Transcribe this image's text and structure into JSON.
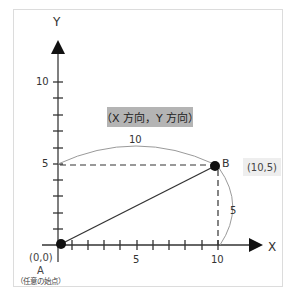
{
  "diagram": {
    "axes": {
      "x_label": "X",
      "y_label": "Y",
      "x_ticks": [
        "5",
        "10"
      ],
      "y_ticks": [
        "10",
        "5"
      ]
    },
    "direction_label": "（X 方向，Y 方向）",
    "horizontal_distance_label": "10",
    "vertical_distance_label": "5",
    "point_a": {
      "name": "A",
      "coords": "(0,0)",
      "caption": "（任意の始点）"
    },
    "point_b": {
      "name": "B",
      "coords": "(10,5)"
    },
    "colors": {
      "axis": "#222222",
      "label_box": "#b4b4b4",
      "coord_box": "#eeeeee",
      "arc": "#9a9a9a",
      "frame": "#dcdcdc"
    }
  }
}
